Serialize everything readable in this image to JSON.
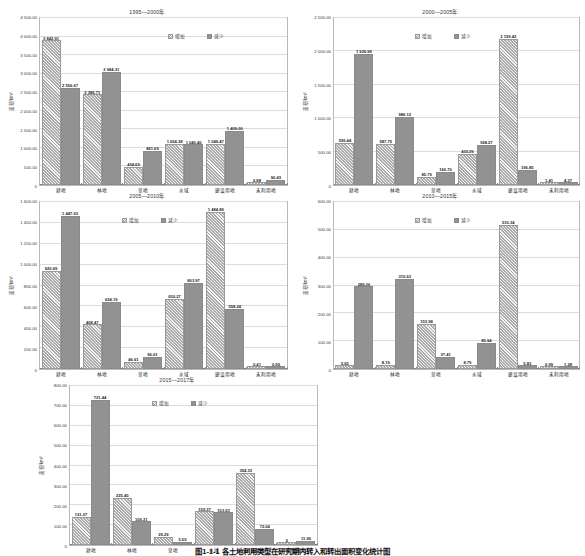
{
  "figure": {
    "caption": "图1-1-1  各土地利用类型在研究期内转入和转出面积变化统计图",
    "ylabel": "面积/km²",
    "legend": {
      "increase": "增加",
      "decrease": "减少"
    },
    "categories": [
      "耕地",
      "林地",
      "草地",
      "水域",
      "建设用地",
      "未利用地"
    ],
    "colors": {
      "increase": "#aaaaaa",
      "decrease": "#929292",
      "axis": "#b9b9b9",
      "text": "#222222"
    }
  },
  "chart_data": [
    {
      "type": "bar",
      "title": "1995—2000年",
      "xlabel": "",
      "ylabel": "面积/km²",
      "ylim": [
        0,
        4500
      ],
      "ytick_step": 500,
      "yticks": [
        "0",
        "500.00",
        "1 000.00",
        "1 500.00",
        "2 000.00",
        "2 500.00",
        "3 000.00",
        "3 500.00",
        "4 000.00",
        "4 500.00"
      ],
      "grid": true,
      "legend_position": "top-right-inside",
      "categories": [
        "耕地",
        "林地",
        "草地",
        "水域",
        "建设用地",
        "未利用地"
      ],
      "series": [
        {
          "name": "增加",
          "values": [
            3842.91,
            2386.71,
            434.69,
            1054.38,
            1049.47,
            6.88
          ]
        },
        {
          "name": "减少",
          "values": [
            2556.67,
            2984.31,
            861.69,
            1040.4,
            1409.0,
            90.43
          ]
        }
      ],
      "labels": {
        "增加": [
          "3 842.91",
          "2 386.71",
          "434.69",
          "1 054.38",
          "1 049.47",
          "6.88"
        ],
        "减少": [
          "2 556.67",
          "2 984.31",
          "861.69",
          "1 040.40",
          "1 409.00",
          "90.43"
        ]
      }
    },
    {
      "type": "bar",
      "title": "2000—2005年",
      "xlabel": "",
      "ylabel": "面积/km²",
      "ylim": [
        0,
        2500
      ],
      "ytick_step": 500,
      "yticks": [
        "0",
        "500.00",
        "1 000.00",
        "1 500.00",
        "2 000.00",
        "2 500.00"
      ],
      "grid": true,
      "legend_position": "top-center-inside",
      "categories": [
        "耕地",
        "林地",
        "草地",
        "水域",
        "建设用地",
        "未利用地"
      ],
      "series": [
        {
          "name": "增加",
          "values": [
            595.44,
            587.75,
            85.79,
            433.29,
            2159.42,
            1.41
          ]
        },
        {
          "name": "减少",
          "values": [
            1926.99,
            986.12,
            166.7,
            568.27,
            196.85,
            4.37
          ]
        }
      ],
      "labels": {
        "增加": [
          "595.44",
          "587.75",
          "85.79",
          "433.29",
          "2 159.42",
          "1.41"
        ],
        "减少": [
          "1 926.99",
          "986.12",
          "166.70",
          "568.27",
          "196.85",
          "4.37"
        ]
      }
    },
    {
      "type": "bar",
      "title": "2005—2010年",
      "xlabel": "",
      "ylabel": "面积/km²",
      "ylim": [
        0,
        1600
      ],
      "ytick_step": 200,
      "yticks": [
        "0",
        "200.00",
        "400.00",
        "600.00",
        "800.00",
        "1 000.00",
        "1 200.00",
        "1 400.00",
        "1 600.00"
      ],
      "grid": true,
      "legend_position": "top-center-inside",
      "categories": [
        "耕地",
        "林地",
        "草地",
        "水域",
        "建设用地",
        "未利用地"
      ],
      "series": [
        {
          "name": "增加",
          "values": [
            920.69,
            408.47,
            46.61,
            650.27,
            1484.89,
            0.41
          ]
        },
        {
          "name": "减少",
          "values": [
            1447.03,
            624.19,
            96.01,
            803.97,
            558.24,
            0.99
          ]
        }
      ],
      "labels": {
        "增加": [
          "920.69",
          "408.47",
          "46.61",
          "650.27",
          "1 484.89",
          "0.41"
        ],
        "减少": [
          "1 447.03",
          "624.19",
          "96.01",
          "803.97",
          "558.24",
          "0.99"
        ]
      }
    },
    {
      "type": "bar",
      "title": "2010—2015年",
      "xlabel": "",
      "ylabel": "面积/km²",
      "ylim": [
        0,
        600
      ],
      "ytick_step": 100,
      "yticks": [
        "0",
        "100.00",
        "200.00",
        "300.00",
        "400.00",
        "500.00",
        "600.00"
      ],
      "grid": true,
      "legend_position": "top-center-inside",
      "categories": [
        "耕地",
        "林地",
        "草地",
        "水域",
        "建设用地",
        "未利用地"
      ],
      "series": [
        {
          "name": "增加",
          "values": [
            5.65,
            8.19,
            153.98,
            8.79,
            510.34,
            0.99
          ]
        },
        {
          "name": "减少",
          "values": [
            289.36,
            315.63,
            37.41,
            85.94,
            5.83,
            1.28
          ]
        }
      ],
      "labels": {
        "增加": [
          "5.65",
          "8.19",
          "153.98",
          "8.79",
          "510.34",
          "0.99"
        ],
        "减少": [
          "289.36",
          "315.63",
          "37.41",
          "85.94",
          "5.83",
          "1.28"
        ]
      }
    },
    {
      "type": "bar",
      "title": "2015—2017年",
      "xlabel": "",
      "ylabel": "面积/km²",
      "ylim": [
        0,
        800
      ],
      "ytick_step": 100,
      "yticks": [
        "0",
        "100.00",
        "200.00",
        "300.00",
        "400.00",
        "500.00",
        "600.00",
        "700.00",
        "800.00"
      ],
      "grid": true,
      "legend_position": "top-center-inside",
      "categories": [
        "耕地",
        "林地",
        "草地",
        "水域",
        "建设用地",
        "未利用地"
      ],
      "series": [
        {
          "name": "增加",
          "values": [
            131.27,
            225.4,
            29.29,
            159.37,
            354.33,
            0.0
          ]
        },
        {
          "name": "减少",
          "values": [
            721.44,
            109.21,
            5.59,
            153.63,
            72.04,
            11.95
          ]
        }
      ],
      "labels": {
        "增加": [
          "131.27",
          "225.40",
          "29.29",
          "159.37",
          "354.33",
          "0"
        ],
        "减少": [
          "721.44",
          "109.21",
          "5.59",
          "153.63",
          "72.04",
          "11.95"
        ]
      }
    }
  ]
}
